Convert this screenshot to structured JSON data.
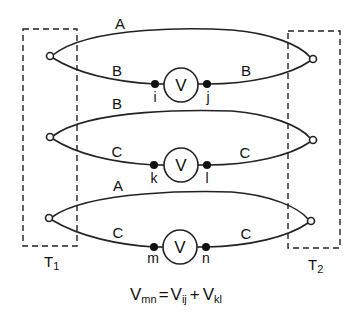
{
  "diagram": {
    "terminals": [
      {
        "id": "T1",
        "label": "T",
        "sub": "1"
      },
      {
        "id": "T2",
        "label": "T",
        "sub": "2"
      }
    ],
    "loops": [
      {
        "upper_wire": "A",
        "lower_wire_left": "B",
        "lower_wire_right": "B",
        "meter": "V",
        "node_left": "i",
        "node_right": "j"
      },
      {
        "upper_wire": "B",
        "lower_wire_left": "C",
        "lower_wire_right": "C",
        "meter": "V",
        "node_left": "k",
        "node_right": "l"
      },
      {
        "upper_wire": "A",
        "lower_wire_left": "C",
        "lower_wire_right": "C",
        "meter": "V",
        "node_left": "m",
        "node_right": "n"
      }
    ],
    "equation": {
      "lhs": "V",
      "lhs_sub": "mn",
      "eq": "=",
      "t1": "V",
      "t1_sub": "ij",
      "plus": "+",
      "t2": "V",
      "t2_sub": "kl"
    }
  }
}
